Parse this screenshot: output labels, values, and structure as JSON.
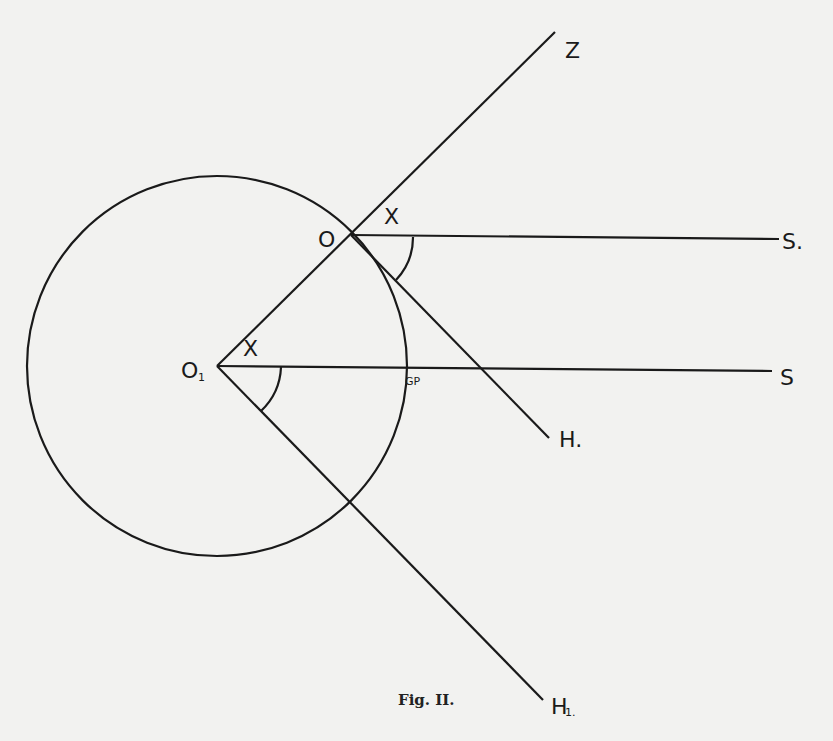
{
  "figure": {
    "caption": "Fig. II.",
    "labels": {
      "Z": "Z",
      "O": "O",
      "O1": "O",
      "O1_sub": "1",
      "S_top": "S.",
      "S_bottom": "S",
      "H": "H.",
      "H1": "H",
      "H1_sub": "1.",
      "x_top": "X",
      "x_bottom": "X",
      "GP": "GP"
    },
    "colors": {
      "background": "#f2f2f0",
      "ink": "#1a1a1a"
    }
  }
}
